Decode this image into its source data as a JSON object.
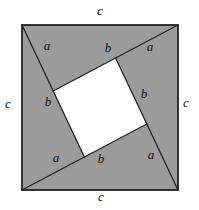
{
  "diagram": {
    "labels": {
      "c_top": "c",
      "c_right": "c",
      "c_bottom": "c",
      "c_left": "c",
      "a_top_left": "a",
      "a_top_right": "a",
      "a_bottom_left": "a",
      "a_bottom_right": "a",
      "b_top": "b",
      "b_left": "b",
      "b_right": "b",
      "b_bottom": "b"
    }
  },
  "colors": {
    "triangle_fill": "#9b9b9b",
    "inner_square_fill": "#ffffff",
    "line_color": "#222222",
    "label_color": "#111111",
    "background": "#ffffff"
  }
}
